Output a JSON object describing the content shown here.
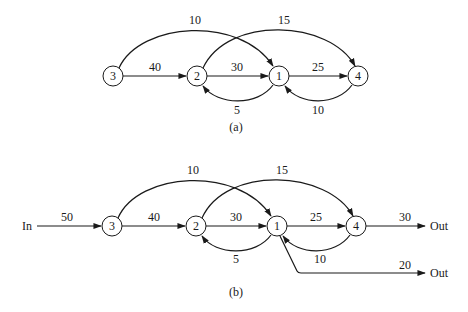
{
  "diagram_a": {
    "caption": "(a)",
    "nodes": [
      {
        "id": "3",
        "label": "3",
        "x": 113,
        "y": 76
      },
      {
        "id": "2",
        "label": "2",
        "x": 197,
        "y": 76
      },
      {
        "id": "1",
        "label": "1",
        "x": 279,
        "y": 76
      },
      {
        "id": "4",
        "label": "4",
        "x": 358,
        "y": 76
      }
    ],
    "edges": [
      {
        "from": "3",
        "to": "2",
        "label": "40"
      },
      {
        "from": "2",
        "to": "1",
        "label": "30"
      },
      {
        "from": "1",
        "to": "4",
        "label": "25"
      },
      {
        "from": "3",
        "to": "1",
        "label": "10"
      },
      {
        "from": "2",
        "to": "4",
        "label": "15"
      },
      {
        "from": "1",
        "to": "2",
        "label": "5"
      },
      {
        "from": "4",
        "to": "1",
        "label": "10"
      }
    ]
  },
  "diagram_b": {
    "caption": "(b)",
    "input_label": "In",
    "output_label_1": "Out",
    "output_label_2": "Out",
    "nodes": [
      {
        "id": "3",
        "label": "3",
        "x": 112,
        "y": 226
      },
      {
        "id": "2",
        "label": "2",
        "x": 196,
        "y": 226
      },
      {
        "id": "1",
        "label": "1",
        "x": 277,
        "y": 226
      },
      {
        "id": "4",
        "label": "4",
        "x": 356,
        "y": 226
      }
    ],
    "edges": [
      {
        "from": "In",
        "to": "3",
        "label": "50"
      },
      {
        "from": "3",
        "to": "2",
        "label": "40"
      },
      {
        "from": "2",
        "to": "1",
        "label": "30"
      },
      {
        "from": "1",
        "to": "4",
        "label": "25"
      },
      {
        "from": "3",
        "to": "1",
        "label": "10"
      },
      {
        "from": "2",
        "to": "4",
        "label": "15"
      },
      {
        "from": "1",
        "to": "2",
        "label": "5"
      },
      {
        "from": "4",
        "to": "1",
        "label": "10"
      },
      {
        "from": "4",
        "to": "Out",
        "label": "30"
      },
      {
        "from": "1",
        "to": "Out",
        "label": "20"
      }
    ]
  }
}
